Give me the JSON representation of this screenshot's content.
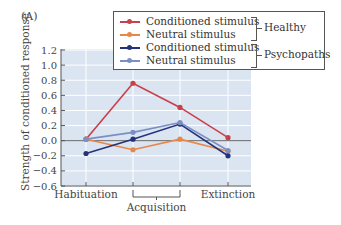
{
  "panel_label": "(A)",
  "chart_data": {
    "type": "line",
    "title": "",
    "xlabel": "",
    "ylabel": "Strength of conditioned response",
    "ylim": [
      -0.6,
      1.2
    ],
    "yticks": [
      -0.6,
      -0.4,
      -0.2,
      0.0,
      0.2,
      0.4,
      0.6,
      0.8,
      1.0,
      1.2
    ],
    "ytick_labels": [
      "−0.6",
      "−0.4",
      "−0.2",
      "0.0",
      "0.2",
      "0.4",
      "0.6",
      "0.8",
      "1.0",
      "1.2"
    ],
    "x": [
      1,
      2,
      3,
      4
    ],
    "category_labels": [
      {
        "label": "Habituation",
        "span": [
          1,
          1
        ]
      },
      {
        "label": "Acquisition",
        "span": [
          2,
          3
        ]
      },
      {
        "label": "Extinction",
        "span": [
          4,
          4
        ]
      }
    ],
    "grid": true,
    "legend_position": "upper right",
    "series": [
      {
        "name": "Conditioned stimulus",
        "group": "Healthy",
        "color": "#c9404a",
        "values": [
          0.02,
          0.76,
          0.44,
          0.04
        ]
      },
      {
        "name": "Neutral stimulus",
        "group": "Healthy",
        "color": "#e8874a",
        "values": [
          0.02,
          -0.12,
          0.02,
          -0.14
        ]
      },
      {
        "name": "Conditioned stimulus",
        "group": "Psychopaths",
        "color": "#23337a",
        "values": [
          -0.17,
          0.02,
          0.22,
          -0.2
        ]
      },
      {
        "name": "Neutral stimulus",
        "group": "Psychopaths",
        "color": "#7b8fc4",
        "values": [
          0.02,
          0.11,
          0.24,
          -0.13
        ]
      }
    ],
    "legend_groups": [
      "Healthy",
      "Psychopaths"
    ]
  },
  "colors": {
    "plot_bg": "#dbe4f1",
    "grid": "#ffffff",
    "axis": "#555555",
    "zero_line": "#6b6b6b"
  }
}
